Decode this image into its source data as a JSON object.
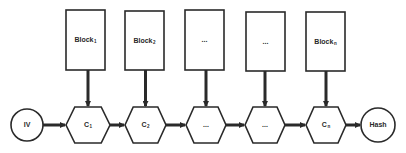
{
  "diagram": {
    "colors": {
      "stroke": "#2a2a2a",
      "fill": "#ffffff",
      "background": "#ffffff"
    },
    "start": {
      "label": "IV",
      "cx": 27,
      "cy": 125,
      "r": 16
    },
    "end": {
      "label": "Hash",
      "cx": 378,
      "cy": 125,
      "r": 17
    },
    "blocks": [
      {
        "label": "Block",
        "sub": "1",
        "x": 66,
        "y": 10,
        "w": 39,
        "h": 60
      },
      {
        "label": "Block",
        "sub": "2",
        "x": 125,
        "y": 11,
        "w": 39,
        "h": 59
      },
      {
        "label": "...",
        "sub": "",
        "x": 185,
        "y": 10,
        "w": 39,
        "h": 60
      },
      {
        "label": "...",
        "sub": "",
        "x": 246,
        "y": 12,
        "w": 39,
        "h": 59
      },
      {
        "label": "Block",
        "sub": "n",
        "x": 306,
        "y": 12,
        "w": 39,
        "h": 59
      }
    ],
    "compress_nodes": [
      {
        "label": "C",
        "sub": "1",
        "x": 66,
        "w": 44
      },
      {
        "label": "C",
        "sub": "2",
        "x": 125,
        "w": 41
      },
      {
        "label": "...",
        "sub": "",
        "x": 186,
        "w": 40
      },
      {
        "label": "...",
        "sub": "",
        "x": 245,
        "w": 40
      },
      {
        "label": "C",
        "sub": "n",
        "x": 306,
        "w": 40
      }
    ],
    "hex_top": 107,
    "hex_bottom": 143
  }
}
